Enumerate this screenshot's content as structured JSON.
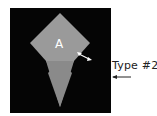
{
  "diagram": {
    "shape_label": "A",
    "callout_label": "Type #2",
    "colors": {
      "background": "#050505",
      "upper_region": "#9a9a9a",
      "band": "#c8c8c8",
      "lower_region": "#8a8a8a",
      "label_text": "#ffffff",
      "callout_text": "#222222"
    }
  }
}
